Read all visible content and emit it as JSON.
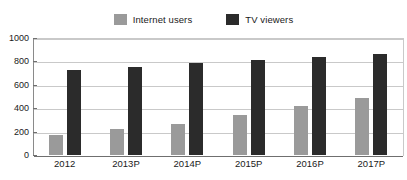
{
  "chart_data": {
    "type": "bar",
    "title": "",
    "subtitle": "",
    "xlabel": "",
    "ylabel": "",
    "categories": [
      "2012",
      "2013P",
      "2014P",
      "2015P",
      "2016P",
      "2017P"
    ],
    "series": [
      {
        "name": "Internet users",
        "color": "#9a9a9a",
        "values": [
          170,
          220,
          265,
          345,
          420,
          485
        ]
      },
      {
        "name": "TV viewers",
        "color": "#2b2b2b",
        "values": [
          725,
          755,
          785,
          810,
          835,
          860
        ]
      }
    ],
    "ylim": [
      0,
      1000
    ],
    "yticks": [
      0,
      200,
      400,
      600,
      800,
      1000
    ],
    "ytick_labels": [
      "0",
      "200",
      "400",
      "600",
      "800",
      "1000"
    ],
    "grid": true,
    "grid_axis": "y",
    "legend": true,
    "legend_position": "top-center",
    "background_color": "#ffffff",
    "grid_color": "#c9c9c9",
    "axis_color": "#6f6f6f"
  },
  "legend": {
    "entries": [
      {
        "label": "Internet users",
        "swatch_name": "legend-swatch-internet-users"
      },
      {
        "label": "TV viewers",
        "swatch_name": "legend-swatch-tv-viewers"
      }
    ]
  }
}
